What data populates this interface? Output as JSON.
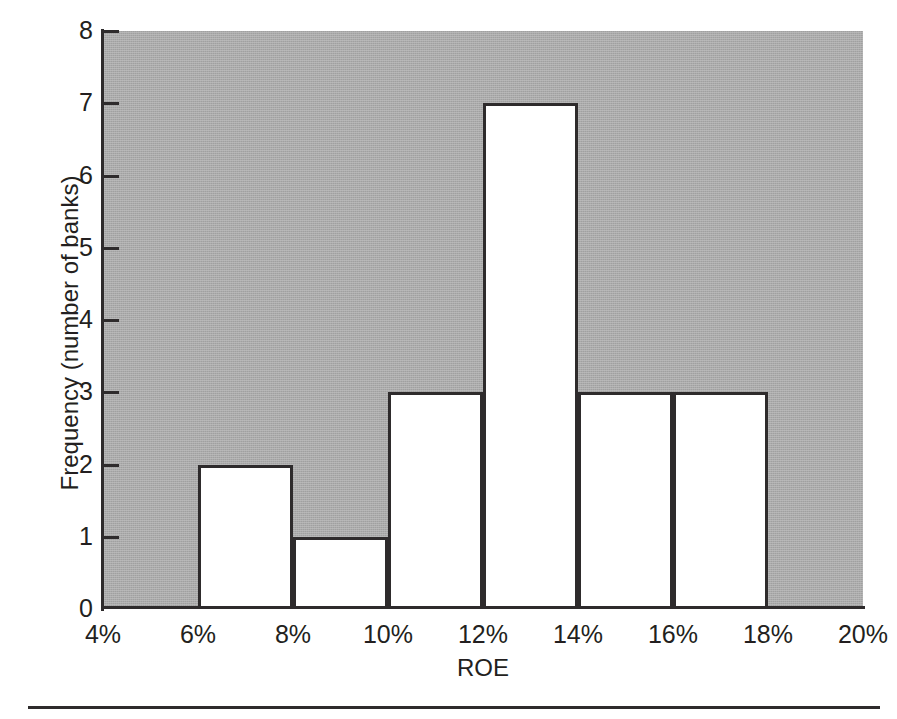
{
  "chart_data": {
    "type": "bar",
    "title": "",
    "subtitle": "",
    "xlabel": "ROE",
    "ylabel": "Frequency (number of banks)",
    "categories": [
      "4%-6%",
      "6%-8%",
      "8%-10%",
      "10%-12%",
      "12%-14%",
      "14%-16%",
      "16%-18%",
      "18%-20%"
    ],
    "bin_edges": [
      4,
      6,
      8,
      10,
      12,
      14,
      16,
      18,
      20
    ],
    "values": [
      0,
      2,
      1,
      3,
      7,
      3,
      3,
      0
    ],
    "xlim": [
      4,
      20
    ],
    "ylim": [
      0,
      8
    ],
    "x_tick_labels": [
      "4%",
      "6%",
      "8%",
      "10%",
      "12%",
      "14%",
      "16%",
      "18%",
      "20%"
    ],
    "x_tick_values": [
      4,
      6,
      8,
      10,
      12,
      14,
      16,
      18,
      20
    ],
    "y_tick_labels": [
      "0",
      "1",
      "2",
      "3",
      "4",
      "5",
      "6",
      "7",
      "8"
    ],
    "y_tick_values": [
      0,
      1,
      2,
      3,
      4,
      5,
      6,
      7,
      8
    ],
    "grid": false,
    "legend": null,
    "annotations": [],
    "colors": {
      "plot_background": "#ababab",
      "bar_fill": "#ffffff",
      "bar_outline": "#2e2b2c",
      "axis": "#2e2b2c",
      "text": "#231f20",
      "page_background": "#ffffff"
    }
  },
  "figure": {
    "bottom_rule": true
  }
}
